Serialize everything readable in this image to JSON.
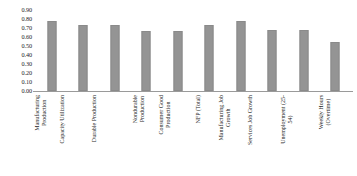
{
  "chart_data": {
    "type": "bar",
    "title": "",
    "subtitle": "",
    "xlabel": "",
    "ylabel": "",
    "ylim": [
      0.0,
      0.9
    ],
    "ytick_step": 0.1,
    "grid": false,
    "legend": null,
    "bar_color": "#949494",
    "axis_color": "#9a9a9a",
    "categories": [
      "Manufacturing Production",
      "Capacity Utilization",
      "Durable Production",
      "Nondurable Production",
      "Consumer Good Production",
      "NFP (Total)",
      "Manufacturing Job Growth",
      "Services Job Growth",
      "Unemployment (25-54)",
      "Weekly Hours (Overtime)"
    ],
    "category_lines": [
      [
        "Manufacturing",
        "Production"
      ],
      [
        "Capacity Utilization",
        ""
      ],
      [
        "Durable Production",
        ""
      ],
      [
        "Nondurable",
        "Production"
      ],
      [
        "Consumer Good",
        "Production"
      ],
      [
        "NFP (Total)",
        ""
      ],
      [
        "Manufacturing Job",
        "Growth"
      ],
      [
        "Services Job Growth",
        ""
      ],
      [
        "Unemployment (25-",
        "54)"
      ],
      [
        "Weekly Hours",
        "(Overtime)"
      ]
    ],
    "values": [
      0.78,
      0.73,
      0.73,
      0.67,
      0.67,
      0.73,
      0.78,
      0.68,
      0.68,
      0.54
    ],
    "ytick_labels": [
      "0.90",
      "0.80",
      "0.70",
      "0.60",
      "0.50",
      "0.40",
      "0.30",
      "0.20",
      "0.10",
      "0.00"
    ],
    "ytick_values": [
      0.9,
      0.8,
      0.7,
      0.6,
      0.5,
      0.4,
      0.3,
      0.2,
      0.1,
      0.0
    ]
  }
}
